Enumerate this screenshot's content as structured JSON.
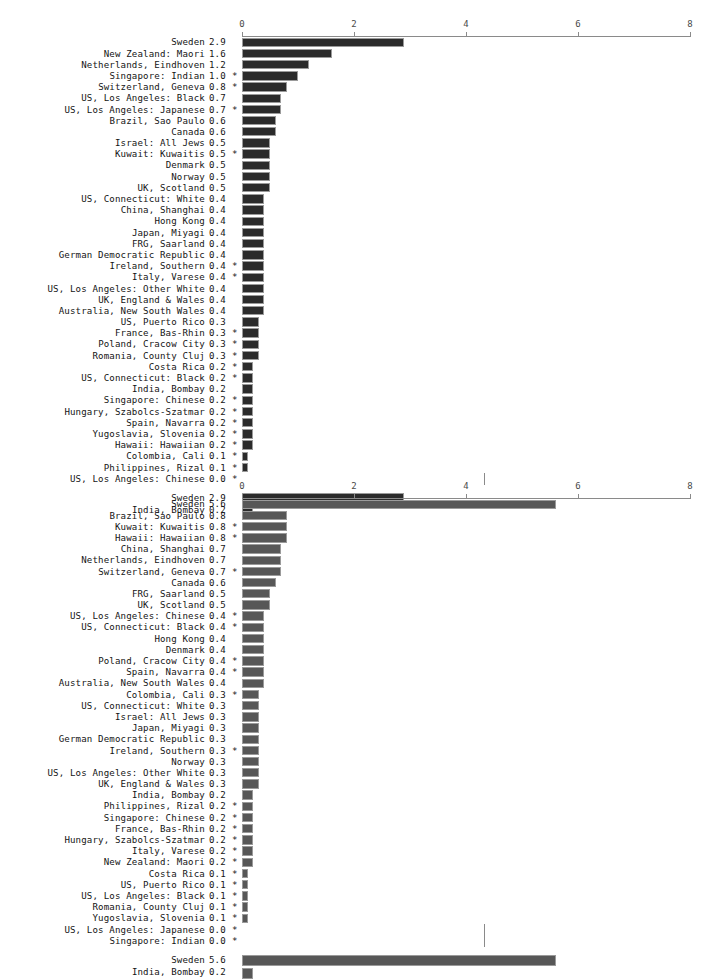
{
  "chart_data": [
    {
      "type": "bar",
      "orientation": "horizontal",
      "title": "",
      "xlabel": "",
      "ylabel": "",
      "xlim": [
        0,
        8
      ],
      "xticks": [
        "0",
        "2",
        "4",
        "6",
        "8"
      ],
      "grid": false,
      "bar_color": "#2b2b2b",
      "bar_edge_color": "#9a9a9a",
      "axis_color": "#8a8a8a",
      "categories": [
        "Sweden",
        "New Zealand: Maori",
        "Netherlands, Eindhoven",
        "Singapore: Indian",
        "Switzerland, Geneva",
        "US, Los Angeles: Black",
        "US, Los Angeles: Japanese",
        "Brazil, Sao Paulo",
        "Canada",
        "Israel: All Jews",
        "Kuwait: Kuwaitis",
        "Denmark",
        "Norway",
        "UK, Scotland",
        "US, Connecticut: White",
        "China, Shanghai",
        "Hong Kong",
        "Japan, Miyagi",
        "FRG, Saarland",
        "German Democratic Republic",
        "Ireland, Southern",
        "Italy, Varese",
        "US, Los Angeles: Other White",
        "UK, England & Wales",
        "Australia, New South Wales",
        "US, Puerto Rico",
        "France, Bas-Rhin",
        "Poland, Cracow City",
        "Romania, County Cluj",
        "Costa Rica",
        "US, Connecticut: Black",
        "India, Bombay",
        "Singapore: Chinese",
        "Hungary, Szabolcs-Szatmar",
        "Spain, Navarra",
        "Yugoslavia, Slovenia",
        "Hawaii: Hawaiian",
        "Colombia, Cali",
        "Philippines, Rizal",
        "US, Los Angeles: Chinese"
      ],
      "values": [
        2.9,
        1.6,
        1.2,
        1.0,
        0.8,
        0.7,
        0.7,
        0.6,
        0.6,
        0.5,
        0.5,
        0.5,
        0.5,
        0.5,
        0.4,
        0.4,
        0.4,
        0.4,
        0.4,
        0.4,
        0.4,
        0.4,
        0.4,
        0.4,
        0.4,
        0.3,
        0.3,
        0.3,
        0.3,
        0.2,
        0.2,
        0.2,
        0.2,
        0.2,
        0.2,
        0.2,
        0.2,
        0.1,
        0.1,
        0.0
      ],
      "value_labels": [
        "2.9",
        "1.6",
        "1.2",
        "1.0",
        "0.8",
        "0.7",
        "0.7",
        "0.6",
        "0.6",
        "0.5",
        "0.5",
        "0.5",
        "0.5",
        "0.5",
        "0.4",
        "0.4",
        "0.4",
        "0.4",
        "0.4",
        "0.4",
        "0.4",
        "0.4",
        "0.4",
        "0.4",
        "0.4",
        "0.3",
        "0.3",
        "0.3",
        "0.3",
        "0.2",
        "0.2",
        "0.2",
        "0.2",
        "0.2",
        "0.2",
        "0.2",
        "0.2",
        "0.1",
        "0.1",
        "0.0"
      ],
      "flags": [
        "",
        "",
        "",
        "*",
        "*",
        "",
        "*",
        "",
        "",
        "",
        "*",
        "",
        "",
        "",
        "",
        "",
        "",
        "",
        "",
        "",
        "*",
        "*",
        "",
        "",
        "",
        "",
        "*",
        "*",
        "*",
        "*",
        "*",
        "",
        "*",
        "*",
        "*",
        "*",
        "*",
        "*",
        "*",
        "*"
      ],
      "summary": {
        "categories": [
          "Sweden",
          "India, Bombay"
        ],
        "values": [
          2.9,
          0.2
        ],
        "value_labels": [
          "2.9",
          "0.2"
        ],
        "flags": [
          "",
          ""
        ]
      }
    },
    {
      "type": "bar",
      "orientation": "horizontal",
      "title": "",
      "xlabel": "",
      "ylabel": "",
      "xlim": [
        0,
        8
      ],
      "xticks": [
        "0",
        "2",
        "4",
        "6",
        "8"
      ],
      "grid": false,
      "bar_color": "#575757",
      "bar_edge_color": "#9a9a9a",
      "axis_color": "#8a8a8a",
      "categories": [
        "Sweden",
        "Brazil, Sao Paulo",
        "Kuwait: Kuwaitis",
        "Hawaii: Hawaiian",
        "China, Shanghai",
        "Netherlands, Eindhoven",
        "Switzerland, Geneva",
        "Canada",
        "FRG, Saarland",
        "UK, Scotland",
        "US, Los Angeles: Chinese",
        "US, Connecticut: Black",
        "Hong Kong",
        "Denmark",
        "Poland, Cracow City",
        "Spain, Navarra",
        "Australia, New South Wales",
        "Colombia, Cali",
        "US, Connecticut: White",
        "Israel: All Jews",
        "Japan, Miyagi",
        "German Democratic Republic",
        "Ireland, Southern",
        "Norway",
        "US, Los Angeles: Other White",
        "UK, England & Wales",
        "India, Bombay",
        "Philippines, Rizal",
        "Singapore: Chinese",
        "France, Bas-Rhin",
        "Hungary, Szabolcs-Szatmar",
        "Italy, Varese",
        "New Zealand: Maori",
        "Costa Rica",
        "US, Puerto Rico",
        "US, Los Angeles: Black",
        "Romania, County Cluj",
        "Yugoslavia, Slovenia",
        "US, Los Angeles: Japanese",
        "Singapore: Indian"
      ],
      "values": [
        5.6,
        0.8,
        0.8,
        0.8,
        0.7,
        0.7,
        0.7,
        0.6,
        0.5,
        0.5,
        0.4,
        0.4,
        0.4,
        0.4,
        0.4,
        0.4,
        0.4,
        0.3,
        0.3,
        0.3,
        0.3,
        0.3,
        0.3,
        0.3,
        0.3,
        0.3,
        0.2,
        0.2,
        0.2,
        0.2,
        0.2,
        0.2,
        0.2,
        0.1,
        0.1,
        0.1,
        0.1,
        0.1,
        0.0,
        0.0
      ],
      "value_labels": [
        "5.6",
        "0.8",
        "0.8",
        "0.8",
        "0.7",
        "0.7",
        "0.7",
        "0.6",
        "0.5",
        "0.5",
        "0.4",
        "0.4",
        "0.4",
        "0.4",
        "0.4",
        "0.4",
        "0.4",
        "0.3",
        "0.3",
        "0.3",
        "0.3",
        "0.3",
        "0.3",
        "0.3",
        "0.3",
        "0.3",
        "0.2",
        "0.2",
        "0.2",
        "0.2",
        "0.2",
        "0.2",
        "0.2",
        "0.1",
        "0.1",
        "0.1",
        "0.1",
        "0.1",
        "0.0",
        "0.0"
      ],
      "flags": [
        "",
        "",
        "*",
        "*",
        "",
        "",
        "*",
        "",
        "",
        "",
        "*",
        "*",
        "",
        "",
        "*",
        "*",
        "",
        "*",
        "",
        "",
        "",
        "",
        "*",
        "",
        "",
        "",
        "",
        "*",
        "*",
        "*",
        "*",
        "*",
        "*",
        "*",
        "*",
        "*",
        "*",
        "*",
        "*",
        "*"
      ],
      "summary": {
        "categories": [
          "Sweden",
          "India, Bombay"
        ],
        "values": [
          5.6,
          0.2
        ],
        "value_labels": [
          "5.6",
          "0.2"
        ],
        "flags": [
          "",
          ""
        ]
      }
    }
  ]
}
